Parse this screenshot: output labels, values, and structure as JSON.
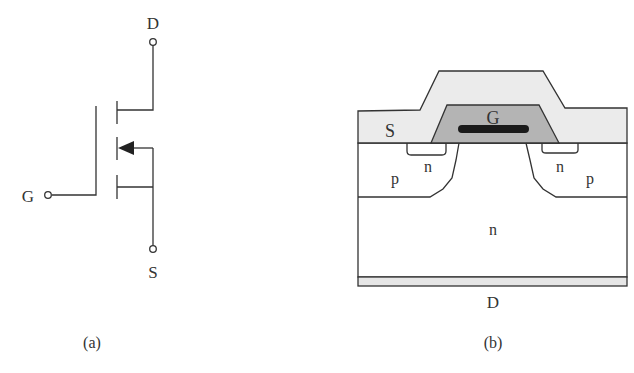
{
  "figure": {
    "panel_a": {
      "caption": "(a)",
      "title": "MOSFET circuit symbol (n-channel enhancement)",
      "terminals": {
        "drain": "D",
        "gate": "G",
        "source": "S"
      }
    },
    "panel_b": {
      "caption": "(b)",
      "title": "MOSFET cross-section",
      "labels": {
        "source": "S",
        "gate": "G",
        "drain": "D",
        "p_left": "p",
        "p_right": "p",
        "n_left": "n",
        "n_right": "n",
        "n_drift": "n"
      }
    },
    "colors": {
      "line": "#333333",
      "metal_fill": "#ebebeb",
      "gate_oxide_fill": "#b4b4b4",
      "gate_bar": "#1a1a1a",
      "substrate_fill": "#ffffff",
      "drain_plate_fill": "#e6e6e6"
    }
  }
}
